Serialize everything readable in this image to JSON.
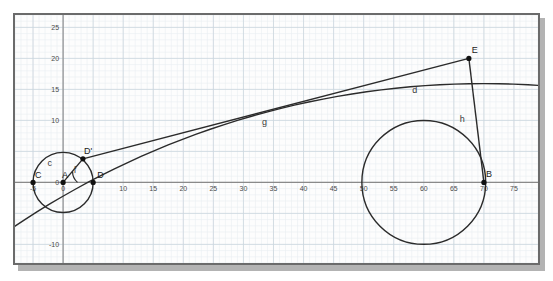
{
  "figure": {
    "title": "",
    "background_color": "#fdfdfd",
    "frame_color": "#6b6b6b",
    "shadow_color": "#b3b3b3",
    "curve_color": "#2b2b2b",
    "grid_major_color": "#ccd6de",
    "grid_minor_color": "#e9eef2",
    "axis_color": "#8a8a8a"
  },
  "chart_data": {
    "type": "scatter",
    "title": "",
    "xlabel": "",
    "ylabel": "",
    "xlim": [
      -8,
      79
    ],
    "ylim": [
      -13,
      27
    ],
    "grid": true,
    "grid_major_step": 5,
    "grid_minor_step": 1,
    "legend": "none",
    "x_ticks": [
      -5,
      0,
      10,
      15,
      20,
      25,
      30,
      35,
      40,
      45,
      50,
      55,
      60,
      65,
      70,
      75
    ],
    "x_tick_labels": [
      "-5",
      "0",
      "10",
      "15",
      "20",
      "25",
      "30",
      "35",
      "40",
      "45",
      "50",
      "55",
      "60",
      "65",
      "70",
      "75"
    ],
    "y_ticks": [
      25,
      20,
      15,
      10,
      0,
      -10
    ],
    "y_tick_labels": [
      "25",
      "20",
      "15",
      "10",
      "0",
      "-10"
    ],
    "points": [
      {
        "name": "C",
        "label": "C",
        "x": -5,
        "y": 0
      },
      {
        "name": "A",
        "label": "A",
        "x": 0,
        "y": 0
      },
      {
        "name": "D",
        "label": "D",
        "x": 5,
        "y": 0
      },
      {
        "name": "D-prime",
        "label": "D'",
        "x": 3.3,
        "y": 3.8
      },
      {
        "name": "E",
        "label": "E",
        "x": 67.5,
        "y": 20.0
      },
      {
        "name": "B",
        "label": "B",
        "x": 70,
        "y": 0
      }
    ],
    "curves": [
      {
        "name": "c",
        "label": "c",
        "kind": "circle",
        "cx": 0,
        "cy": 0,
        "r": 5,
        "label_x": -2.2,
        "label_y": 2.6
      },
      {
        "name": "d",
        "label": "d",
        "kind": "circle",
        "cx": 60,
        "cy": 0,
        "r": 10.3,
        "label_x": 58.5,
        "label_y": 14.4
      },
      {
        "name": "g",
        "label": "g",
        "kind": "segment",
        "x1": 3.3,
        "y1": 3.8,
        "x2": 67.5,
        "y2": 20.0,
        "label_x": 33.5,
        "label_y": 9.3
      },
      {
        "name": "h",
        "label": "h",
        "kind": "segment",
        "x1": 67.5,
        "y1": 20.0,
        "x2": 70,
        "y2": 0,
        "label_x": 66.4,
        "label_y": 9.8
      },
      {
        "name": "big-arc",
        "label": "",
        "kind": "arc",
        "cx": 70,
        "cy": -120,
        "r": 140.2,
        "label_x": 0,
        "label_y": 0
      },
      {
        "name": "f",
        "label": "f",
        "kind": "angle-arc",
        "cx": 0,
        "cy": 0,
        "r": 2.4,
        "label_x": 2.0,
        "label_y": 1.5
      }
    ]
  }
}
